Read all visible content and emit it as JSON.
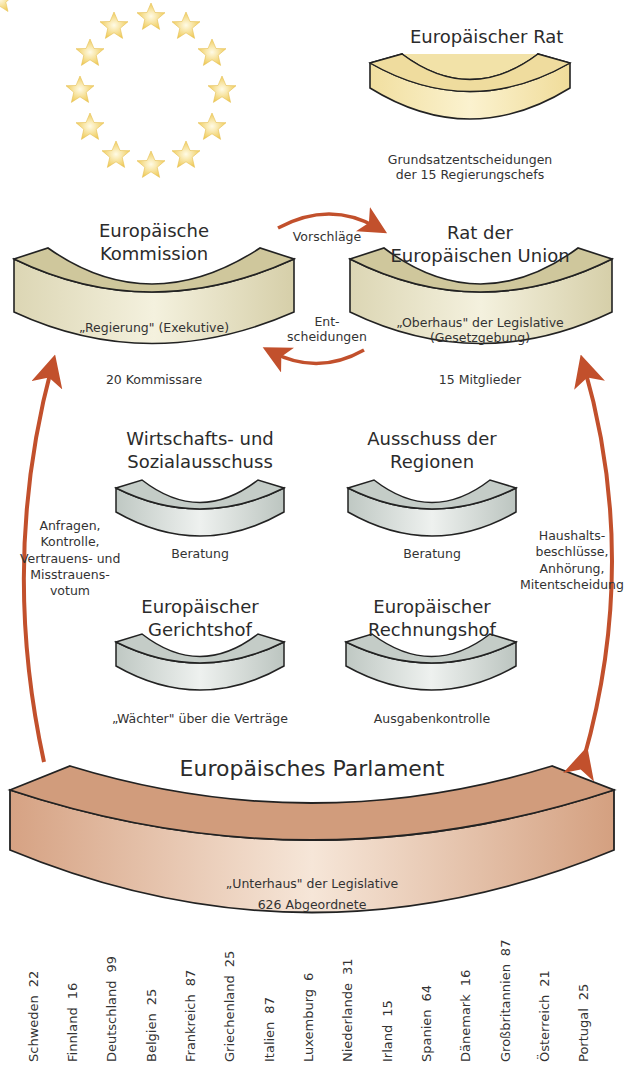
{
  "diagram": {
    "type": "organigram",
    "colors": {
      "arrow": "#c2502c",
      "rat_fill": "#f5e6b0",
      "kommission_fill": "#d9d2a8",
      "grey_fill": "#c9d0cc",
      "parlament_fill": "#d9a587",
      "outline": "#222222",
      "star": "#f3d36c"
    },
    "emblem": {
      "name": "EU-Sternenkranz",
      "stars": 12
    },
    "europaeischer_rat": {
      "title": "Europäischer Rat",
      "description_lines": [
        "Grundsatzentscheidungen",
        "der 15 Regierungschefs"
      ]
    },
    "kommission": {
      "title_lines": [
        "Europäische",
        "Kommission"
      ],
      "inner_label": "„Regierung\" (Exekutive)",
      "members": "20 Kommissare"
    },
    "rat_der_eu": {
      "title_lines": [
        "Rat der",
        "Europäischen Union"
      ],
      "inner_label_lines": [
        "„Oberhaus\" der Legislative",
        "(Gesetzgebung)"
      ],
      "members": "15 Mitglieder"
    },
    "arrows": {
      "kommission_to_rat": "Vorschläge",
      "rat_to_kommission_lines": [
        "Ent-",
        "scheidungen"
      ],
      "parlament_to_kommission_lines": [
        "Anfragen,",
        "Kontrolle,",
        "Vertrauens- und",
        "Misstrauens-",
        "votum"
      ],
      "parlament_rat_lines": [
        "Haushalts-",
        "beschlüsse,",
        "Anhörung,",
        "Mitentscheidung"
      ]
    },
    "wsa": {
      "title_lines": [
        "Wirtschafts- und",
        "Sozialausschuss"
      ],
      "role": "Beratung"
    },
    "adr": {
      "title_lines": [
        "Ausschuss der",
        "Regionen"
      ],
      "role": "Beratung"
    },
    "gerichtshof": {
      "title_lines": [
        "Europäischer",
        "Gerichtshof"
      ],
      "role": "„Wächter\" über die Verträge"
    },
    "rechnungshof": {
      "title_lines": [
        "Europäischer",
        "Rechnungshof"
      ],
      "role": "Ausgabenkontrolle"
    },
    "parlament": {
      "title": "Europäisches Parlament",
      "inner_label": "„Unterhaus\" der Legislative",
      "members": "626 Abgeordnete"
    },
    "countries": [
      {
        "name": "Schweden",
        "seats": "22"
      },
      {
        "name": "Finnland",
        "seats": "16"
      },
      {
        "name": "Deutschland",
        "seats": "99"
      },
      {
        "name": "Belgien",
        "seats": "25"
      },
      {
        "name": "Frankreich",
        "seats": "87"
      },
      {
        "name": "Griechenland",
        "seats": "25"
      },
      {
        "name": "Italien",
        "seats": "87"
      },
      {
        "name": "Luxemburg",
        "seats": "6"
      },
      {
        "name": "Niederlande",
        "seats": "31"
      },
      {
        "name": "Irland",
        "seats": "15"
      },
      {
        "name": "Spanien",
        "seats": "64"
      },
      {
        "name": "Dänemark",
        "seats": "16"
      },
      {
        "name": "Großbritannien",
        "seats": "87"
      },
      {
        "name": "Österreich",
        "seats": "21"
      },
      {
        "name": "Portugal",
        "seats": "25"
      }
    ]
  }
}
